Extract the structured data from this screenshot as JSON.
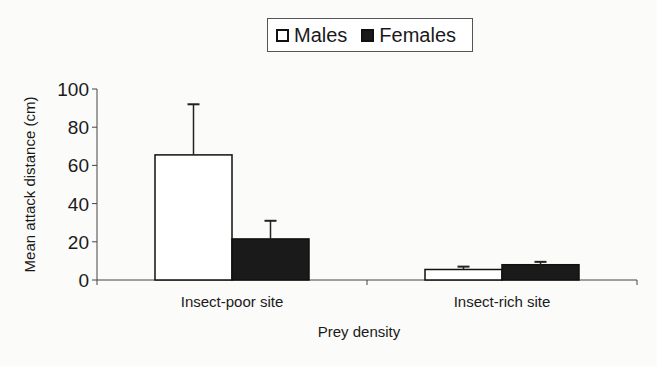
{
  "chart_data": {
    "type": "bar",
    "title": "",
    "xlabel": "Prey density",
    "ylabel": "Mean attack distance (cm)",
    "categories": [
      "Insect-poor site",
      "Insect-rich site"
    ],
    "series": [
      {
        "name": "Males",
        "color": "#ffffff",
        "values": [
          65.5,
          5.5
        ],
        "error_upper": [
          92,
          7
        ]
      },
      {
        "name": "Females",
        "color": "#1a1a1a",
        "values": [
          21.5,
          8
        ],
        "error_upper": [
          31,
          9.5
        ]
      }
    ],
    "ylim": [
      0,
      100
    ],
    "yticks": [
      0,
      20,
      40,
      60,
      80,
      100
    ],
    "grid": false,
    "legend_position": "top-center"
  },
  "legend": {
    "males": "Males",
    "females": "Females"
  }
}
